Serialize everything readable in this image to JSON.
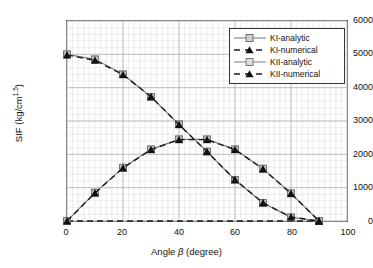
{
  "chart_data": {
    "type": "line",
    "title": "",
    "xlabel": "Angle β (degree)",
    "ylabel": "SIF  (kg/cm1.5)",
    "ylabel_base": "SIF  (kg/cm",
    "ylabel_exp": "1.5",
    "ylabel_close": ")",
    "xlabel_pre": "Angle ",
    "xlabel_sym": "β",
    "xlabel_post": " (degree)",
    "x": [
      0,
      10,
      20,
      30,
      40,
      50,
      60,
      70,
      80,
      90
    ],
    "xlim": [
      0,
      100
    ],
    "ylim": [
      0,
      6000
    ],
    "xticks": [
      0,
      20,
      40,
      60,
      80,
      100
    ],
    "xticklabels": [
      "0",
      "20",
      "40",
      "60",
      "80",
      "100"
    ],
    "yticks": [
      0,
      1000,
      2000,
      3000,
      4000,
      5000,
      6000
    ],
    "yticklabels": [
      "0",
      "1000",
      "2000",
      "3000",
      "4000",
      "5000",
      "6000"
    ],
    "minor_grid": true,
    "minor_x_step": 2,
    "minor_y_step": 200,
    "grid": true,
    "legend_position": "upper-right",
    "series": [
      {
        "name": "KI-analytic",
        "marker": "square",
        "linestyle": "solid",
        "color": "#808080",
        "values": [
          5000,
          4850,
          4400,
          3720,
          2900,
          2080,
          1230,
          540,
          110,
          0
        ]
      },
      {
        "name": "KI-numerical",
        "marker": "triangle",
        "linestyle": "dashed",
        "color": "#1a1a1a",
        "values": [
          4980,
          4820,
          4390,
          3730,
          2890,
          2080,
          1240,
          545,
          120,
          0
        ]
      },
      {
        "name": "KII-analytic",
        "marker": "square",
        "linestyle": "solid",
        "color": "#808080",
        "values": [
          0,
          850,
          1600,
          2150,
          2450,
          2450,
          2150,
          1570,
          830,
          0
        ]
      },
      {
        "name": "KII-numerical",
        "marker": "triangle",
        "linestyle": "dashed",
        "color": "#1a1a1a",
        "values": [
          0,
          840,
          1590,
          2140,
          2440,
          2440,
          2140,
          1560,
          825,
          0
        ]
      }
    ],
    "zero_reference_line": {
      "name": "zero-baseline",
      "linestyle": "dashed",
      "color": "#1a1a1a",
      "y": 0
    }
  },
  "legend": {
    "items": [
      {
        "label": "KI-analytic",
        "key": "line-square-gray"
      },
      {
        "label": "KI-numerical",
        "key": "dashed-triangle-black"
      },
      {
        "label": "KII-analytic",
        "key": "line-square-gray"
      },
      {
        "label": "KII-numerical",
        "key": "dashed-triangle-black"
      }
    ]
  },
  "colors": {
    "analytic": "#808080",
    "numerical": "#1a1a1a",
    "grid_minor": "#d9d9d9",
    "grid_major": "#b5b5b5",
    "axis": "#444444",
    "background": "#ffffff"
  }
}
